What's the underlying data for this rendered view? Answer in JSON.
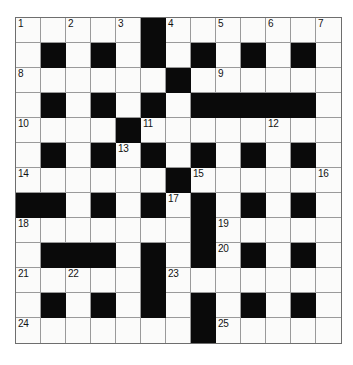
{
  "puzzle": {
    "title": "Crossword Grid",
    "type": "crossword",
    "size": {
      "rows": 13,
      "cols": 13
    },
    "cell_px": 25,
    "colors": {
      "block": "#0a0a0a",
      "open": "#fbfbfa",
      "grid_line": "#9a9a9a",
      "border": "#6e6e6e",
      "number_text": "#131313",
      "page_background": "#ffffff"
    },
    "legend": {
      "black_cell_label": "block",
      "white_cell_label": "open cell"
    },
    "grid": [
      [
        "open",
        "open",
        "open",
        "open",
        "open",
        "block",
        "open",
        "open",
        "open",
        "open",
        "open",
        "open",
        "open"
      ],
      [
        "open",
        "block",
        "open",
        "block",
        "open",
        "block",
        "open",
        "block",
        "open",
        "block",
        "open",
        "block",
        "open"
      ],
      [
        "open",
        "open",
        "open",
        "open",
        "open",
        "open",
        "block",
        "open",
        "open",
        "open",
        "open",
        "open",
        "open"
      ],
      [
        "open",
        "block",
        "open",
        "block",
        "open",
        "block",
        "open",
        "block",
        "block",
        "block",
        "block",
        "block",
        "open"
      ],
      [
        "open",
        "open",
        "open",
        "open",
        "block",
        "open",
        "open",
        "open",
        "open",
        "open",
        "open",
        "open",
        "open"
      ],
      [
        "open",
        "block",
        "open",
        "block",
        "open",
        "block",
        "open",
        "block",
        "open",
        "block",
        "open",
        "block",
        "open"
      ],
      [
        "open",
        "open",
        "open",
        "open",
        "open",
        "open",
        "block",
        "open",
        "open",
        "open",
        "open",
        "open",
        "open"
      ],
      [
        "block",
        "block",
        "open",
        "block",
        "open",
        "block",
        "open",
        "block",
        "open",
        "block",
        "open",
        "block",
        "open"
      ],
      [
        "open",
        "open",
        "open",
        "open",
        "open",
        "open",
        "open",
        "block",
        "open",
        "open",
        "open",
        "open",
        "open"
      ],
      [
        "open",
        "block",
        "block",
        "block",
        "open",
        "block",
        "open",
        "block",
        "open",
        "block",
        "open",
        "block",
        "open"
      ],
      [
        "open",
        "open",
        "open",
        "open",
        "open",
        "block",
        "open",
        "open",
        "open",
        "open",
        "open",
        "open",
        "open"
      ],
      [
        "open",
        "block",
        "open",
        "block",
        "open",
        "block",
        "open",
        "block",
        "open",
        "block",
        "open",
        "block",
        "open"
      ],
      [
        "open",
        "open",
        "open",
        "open",
        "open",
        "open",
        "open",
        "block",
        "open",
        "open",
        "open",
        "open",
        "open"
      ]
    ],
    "numbers": [
      {
        "n": "1",
        "row": 1,
        "col": 1
      },
      {
        "n": "2",
        "row": 1,
        "col": 3
      },
      {
        "n": "3",
        "row": 1,
        "col": 5
      },
      {
        "n": "4",
        "row": 1,
        "col": 7
      },
      {
        "n": "5",
        "row": 1,
        "col": 9
      },
      {
        "n": "6",
        "row": 1,
        "col": 11
      },
      {
        "n": "7",
        "row": 1,
        "col": 13
      },
      {
        "n": "8",
        "row": 3,
        "col": 1
      },
      {
        "n": "9",
        "row": 3,
        "col": 9
      },
      {
        "n": "10",
        "row": 5,
        "col": 1
      },
      {
        "n": "11",
        "row": 5,
        "col": 6
      },
      {
        "n": "12",
        "row": 5,
        "col": 11
      },
      {
        "n": "13",
        "row": 6,
        "col": 5
      },
      {
        "n": "14",
        "row": 7,
        "col": 1
      },
      {
        "n": "15",
        "row": 7,
        "col": 8
      },
      {
        "n": "16",
        "row": 7,
        "col": 13
      },
      {
        "n": "17",
        "row": 8,
        "col": 7
      },
      {
        "n": "18",
        "row": 9,
        "col": 1
      },
      {
        "n": "19",
        "row": 9,
        "col": 9
      },
      {
        "n": "20",
        "row": 10,
        "col": 9
      },
      {
        "n": "21",
        "row": 11,
        "col": 1
      },
      {
        "n": "22",
        "row": 11,
        "col": 3
      },
      {
        "n": "23",
        "row": 11,
        "col": 7
      },
      {
        "n": "24",
        "row": 13,
        "col": 1
      },
      {
        "n": "25",
        "row": 13,
        "col": 9
      }
    ]
  }
}
